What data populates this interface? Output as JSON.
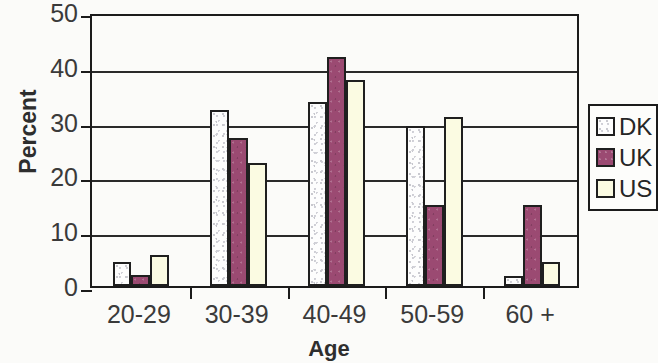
{
  "chart_data": {
    "type": "bar",
    "title": "",
    "xlabel": "Age",
    "ylabel": "Percent",
    "categories": [
      "20-29",
      "30-39",
      "40-49",
      "50-59",
      "60 +"
    ],
    "series": [
      {
        "name": "DK",
        "color": "#fdfdfd",
        "values": [
          4.4,
          32.2,
          33.6,
          29.2,
          1.8
        ]
      },
      {
        "name": "UK",
        "color": "#9b4a72",
        "values": [
          2.0,
          27.0,
          41.8,
          14.8,
          14.8
        ]
      },
      {
        "name": "US",
        "color": "#fbfbe2",
        "values": [
          5.6,
          22.5,
          37.6,
          30.8,
          4.4
        ]
      }
    ],
    "ylim": [
      0,
      50
    ],
    "yticks": [
      0,
      10,
      20,
      30,
      40,
      50
    ],
    "ytick_labels": [
      "0",
      "10",
      "20",
      "30",
      "40",
      "50"
    ],
    "grid": true,
    "grid_axis": "y",
    "legend_position": "right"
  },
  "legend": {
    "entries": [
      {
        "label": "DK"
      },
      {
        "label": "UK"
      },
      {
        "label": "US"
      }
    ]
  }
}
